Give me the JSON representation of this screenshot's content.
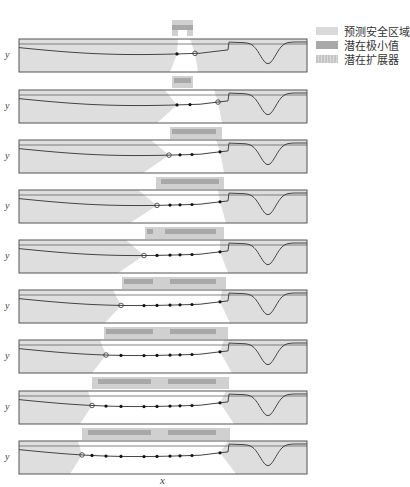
{
  "figure": {
    "panel_count": 9,
    "x_axis_label": "x",
    "y_axis_label": "y"
  },
  "legend": {
    "items": [
      {
        "label": "预测安全区域",
        "color": "#d9d9d9",
        "pattern": "solid"
      },
      {
        "label": "潜在极小值",
        "color": "#a8a8a8",
        "pattern": "solid"
      },
      {
        "label": "潜在扩展器",
        "color": "#c8c8c8",
        "pattern": "hatched"
      }
    ]
  },
  "colors": {
    "background": "#ffffff",
    "panel_fill": "#dedede",
    "safe_region": "#ffffff",
    "curve": "#444444",
    "threshold": "#666666",
    "frame": "#555555",
    "minimizer_bar": "#a8a8a8",
    "expander_bar": "#d0d0d0"
  },
  "panels": [
    {
      "index": 1,
      "top": 39,
      "safe": [
        170,
        198
      ],
      "points": [
        177
      ],
      "next": 195,
      "bars": {
        "min": [
          [
            172,
            193
          ]
        ],
        "exp": [
          [
            172,
            193
          ]
        ]
      }
    },
    {
      "index": 2,
      "top": 90,
      "safe": [
        157,
        222
      ],
      "points": [
        177,
        190
      ],
      "next": 218,
      "bars": {
        "min": [
          [
            170,
            218
          ]
        ],
        "exp": [
          [
            170,
            222
          ]
        ]
      }
    },
    {
      "index": 3,
      "top": 140,
      "safe": [
        143,
        224
      ],
      "points": [
        180,
        192,
        220
      ],
      "next": 169,
      "bars": {
        "min": [
          [
            159,
            221
          ]
        ],
        "exp": [
          [
            156,
            224
          ]
        ]
      }
    },
    {
      "index": 4,
      "top": 190,
      "safe": [
        130,
        226
      ],
      "points": [
        170,
        180,
        192,
        220
      ],
      "next": 157,
      "bars": {
        "min": [
          [
            145,
            155
          ],
          [
            163,
            218
          ]
        ],
        "exp": [
          [
            145,
            224
          ]
        ]
      }
    },
    {
      "index": 5,
      "top": 240,
      "safe": [
        118,
        228
      ],
      "points": [
        157,
        170,
        180,
        192,
        220
      ],
      "next": 144,
      "bars": {
        "min": [
          [
            122,
            155
          ],
          [
            168,
            218
          ]
        ],
        "exp": [
          [
            122,
            226
          ]
        ]
      }
    },
    {
      "index": 6,
      "top": 290,
      "safe": [
        105,
        230
      ],
      "points": [
        144,
        157,
        170,
        180,
        192,
        220
      ],
      "next": 121,
      "bars": {
        "min": [
          [
            104,
            155
          ],
          [
            168,
            218
          ]
        ],
        "exp": [
          [
            104,
            228
          ]
        ]
      }
    },
    {
      "index": 7,
      "top": 340,
      "safe": [
        92,
        232
      ],
      "points": [
        121,
        144,
        157,
        170,
        180,
        192,
        220
      ],
      "next": 106,
      "bars": {
        "min": [
          [
            96,
            153
          ],
          [
            166,
            218
          ]
        ],
        "exp": [
          [
            92,
            229
          ]
        ]
      }
    },
    {
      "index": 8,
      "top": 391,
      "safe": [
        80,
        234
      ],
      "points": [
        106,
        121,
        144,
        157,
        170,
        180,
        192,
        220
      ],
      "next": 92,
      "bars": {
        "min": [
          [
            86,
            153
          ],
          [
            166,
            218
          ]
        ],
        "exp": [
          [
            82,
            230
          ]
        ]
      }
    },
    {
      "index": 9,
      "top": 441,
      "safe": [
        70,
        236
      ],
      "points": [
        92,
        106,
        121,
        144,
        157,
        170,
        180,
        192,
        220
      ],
      "next": 82,
      "bars": null
    }
  ]
}
